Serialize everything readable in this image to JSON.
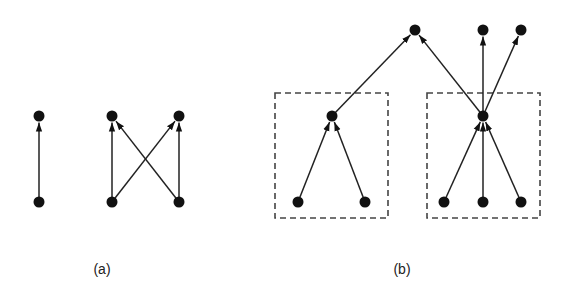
{
  "figure": {
    "colors": {
      "ink": "#111111",
      "edge": "#222222",
      "box": "#444444",
      "background": "#ffffff"
    },
    "panels": [
      {
        "id": "a",
        "caption": "(a)",
        "caption_pos": [
          102,
          274
        ],
        "nodes": [
          {
            "id": "a1",
            "x": 39,
            "y": 116
          },
          {
            "id": "a2",
            "x": 39,
            "y": 202
          },
          {
            "id": "a3",
            "x": 112,
            "y": 116
          },
          {
            "id": "a4",
            "x": 179,
            "y": 116
          },
          {
            "id": "a5",
            "x": 112,
            "y": 202
          },
          {
            "id": "a6",
            "x": 179,
            "y": 202
          }
        ],
        "edges": [
          {
            "from": "a2",
            "to": "a1"
          },
          {
            "from": "a5",
            "to": "a3"
          },
          {
            "from": "a5",
            "to": "a4"
          },
          {
            "from": "a6",
            "to": "a3"
          },
          {
            "from": "a6",
            "to": "a4"
          }
        ],
        "boxes": []
      },
      {
        "id": "b",
        "caption": "(b)",
        "caption_pos": [
          402,
          274
        ],
        "nodes": [
          {
            "id": "t1",
            "x": 415,
            "y": 30
          },
          {
            "id": "t2",
            "x": 483,
            "y": 30
          },
          {
            "id": "t3",
            "x": 521,
            "y": 30
          },
          {
            "id": "m1",
            "x": 332,
            "y": 116
          },
          {
            "id": "m2",
            "x": 483,
            "y": 116
          },
          {
            "id": "b1",
            "x": 298,
            "y": 202
          },
          {
            "id": "b2",
            "x": 365,
            "y": 202
          },
          {
            "id": "b3",
            "x": 444,
            "y": 202
          },
          {
            "id": "b4",
            "x": 483,
            "y": 202
          },
          {
            "id": "b5",
            "x": 521,
            "y": 202
          }
        ],
        "edges": [
          {
            "from": "m1",
            "to": "t1"
          },
          {
            "from": "m2",
            "to": "t1"
          },
          {
            "from": "m2",
            "to": "t2"
          },
          {
            "from": "m2",
            "to": "t3"
          },
          {
            "from": "b1",
            "to": "m1"
          },
          {
            "from": "b2",
            "to": "m1"
          },
          {
            "from": "b3",
            "to": "m2"
          },
          {
            "from": "b4",
            "to": "m2"
          },
          {
            "from": "b5",
            "to": "m2"
          }
        ],
        "boxes": [
          {
            "id": "box-left",
            "x": 275,
            "y": 93,
            "w": 113,
            "h": 125
          },
          {
            "id": "box-right",
            "x": 427,
            "y": 93,
            "w": 113,
            "h": 125
          }
        ]
      }
    ]
  }
}
